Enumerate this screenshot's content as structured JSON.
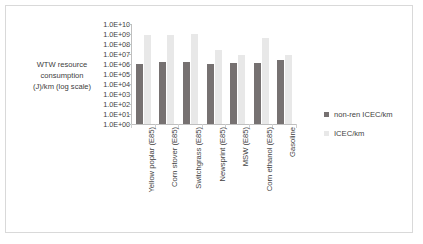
{
  "chart_data": {
    "type": "bar",
    "title": "",
    "xlabel": "",
    "ylabel": "WTW resource consumption (J)/km (log scale)",
    "ylabel_lines": [
      "WTW resource",
      "consumption",
      "(J)/km (log scale)"
    ],
    "scale": "log",
    "ylim": [
      1,
      10000000000
    ],
    "grid": false,
    "legend_position": "right",
    "tick_labels": [
      "1.0E+10",
      "1.0E+09",
      "1.0E+08",
      "1.0E+07",
      "1.0E+06",
      "1.0E+05",
      "1.0E+04",
      "1.0E+03",
      "1.0E+02",
      "1.0E+01",
      "1.0E+00"
    ],
    "tick_values": [
      10000000000,
      1000000000,
      100000000,
      10000000,
      1000000,
      100000,
      10000,
      1000,
      100,
      10,
      1
    ],
    "categories": [
      "Yellow poplar (E85)",
      "Corn stover (E85)",
      "Switchgrass (E85)",
      "Newsprint (E85)",
      "MSW (E85)",
      "Corn ethanol (E85)",
      "Gasoline"
    ],
    "series": [
      {
        "name": "non-ren ICEC/km",
        "color": "#767171",
        "values": [
          1000000.0,
          1500000.0,
          1500000.0,
          1000000.0,
          1200000.0,
          1200000.0,
          2500000.0
        ]
      },
      {
        "name": "ICEC/km",
        "color": "#e8e8e8",
        "values": [
          850000000.0,
          750000000.0,
          1100000000.0,
          25000000.0,
          8000000.0,
          400000000.0,
          8000000.0
        ]
      }
    ]
  },
  "legend": {
    "items": [
      {
        "label": "non-ren ICEC/km"
      },
      {
        "label": "ICEC/km"
      }
    ]
  }
}
